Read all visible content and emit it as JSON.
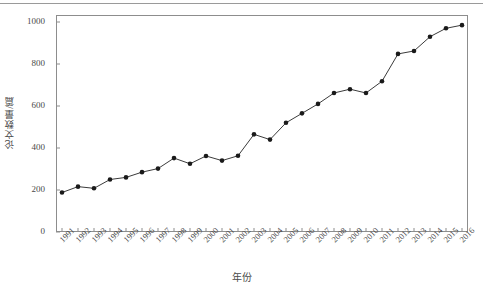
{
  "figure": {
    "background_color": "#ffffff",
    "frame_color": "#8d8d8d",
    "line_color": "#3b3b3b",
    "marker_color": "#1a1a1a",
    "text_color": "#4a4a4a",
    "top_rule_color": "#9a9a9a",
    "caption_text": ""
  },
  "chart_data": {
    "type": "line",
    "title": "",
    "subtitle": "",
    "xlabel": "年份",
    "ylabel": "论文数量/篇",
    "categories": [
      "1991",
      "1992",
      "1993",
      "1994",
      "1995",
      "1996",
      "1997",
      "1998",
      "1999",
      "2000",
      "2001",
      "2002",
      "2003",
      "2004",
      "2005",
      "2006",
      "2007",
      "2008",
      "2009",
      "2010",
      "2011",
      "2012",
      "2013",
      "2014",
      "2015",
      "2016"
    ],
    "values": [
      188,
      216,
      208,
      250,
      260,
      285,
      302,
      352,
      325,
      362,
      340,
      363,
      465,
      440,
      520,
      565,
      610,
      662,
      680,
      662,
      718,
      848,
      862,
      930,
      970,
      985
    ],
    "series": [
      {
        "name": "论文数量",
        "values": [
          188,
          216,
          208,
          250,
          260,
          285,
          302,
          352,
          325,
          362,
          340,
          363,
          465,
          440,
          520,
          565,
          610,
          662,
          680,
          662,
          718,
          848,
          862,
          930,
          970,
          985
        ]
      }
    ],
    "ylim": [
      0,
      1050
    ],
    "xlim": [
      "1991",
      "2016"
    ],
    "yticks": [
      0,
      200,
      400,
      600,
      800,
      1000
    ],
    "ytick_labels": [
      "0",
      "200",
      "400",
      "600",
      "800",
      "1000"
    ],
    "xtick_labels": [
      "1991",
      "1992",
      "1993",
      "1994",
      "1995",
      "1996",
      "1997",
      "1998",
      "1999",
      "2000",
      "2001",
      "2002",
      "2003",
      "2004",
      "2005",
      "2006",
      "2007",
      "2008",
      "2009",
      "2010",
      "2011",
      "2012",
      "2013",
      "2014",
      "2015",
      "2016"
    ],
    "grid": false,
    "legend": false,
    "legend_position": "none",
    "marker": "circle",
    "xtick_rotation": -45,
    "annotations": []
  }
}
